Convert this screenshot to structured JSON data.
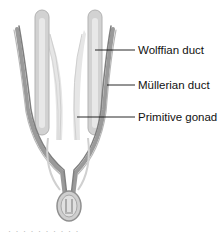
{
  "figure": {
    "type": "anatomical illustration",
    "colors": {
      "duct_dark": "#8a8a8a",
      "duct_mid": "#a6a6a6",
      "gonad_fill": "#cfcfcf",
      "gonad_light": "#e3e3e3",
      "leader_line": "#111111",
      "label_text": "#111111"
    }
  },
  "labels": [
    {
      "id": "wolffian",
      "text": "Wolffian duct"
    },
    {
      "id": "mullerian",
      "text": "Müllerian duct"
    },
    {
      "id": "gonad",
      "text": "Primitive gonad"
    }
  ],
  "caption": {
    "text": "· · ·  · · ·  · · · ·"
  }
}
